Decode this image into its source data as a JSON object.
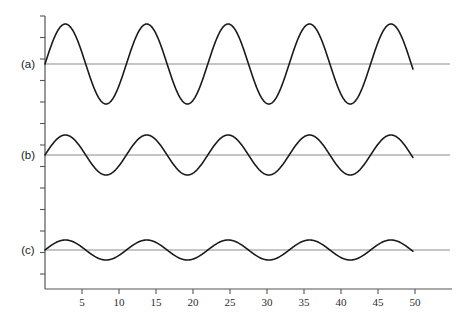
{
  "figure": {
    "background_color": "#ffffff",
    "curve_color": "#1a1a1a",
    "baseline_color": "#8c8c8c",
    "axis_color": "#555555",
    "tick_label_color": "#2b2b2b"
  },
  "chart_data": {
    "type": "line",
    "title": "",
    "subtitle": "",
    "xlabel": "",
    "ylabel": "",
    "grid": false,
    "legend_position": "left",
    "xlim": [
      0,
      55
    ],
    "ylim": [
      -1.1,
      1.1
    ],
    "x_ticks": [
      5,
      10,
      15,
      20,
      25,
      30,
      35,
      40,
      45,
      50
    ],
    "x_tick_labels": [
      "5",
      "10",
      "15",
      "20",
      "25",
      "30",
      "35",
      "40",
      "45",
      "50"
    ],
    "y_ticks": [],
    "y_tick_labels": [],
    "x_start": 0,
    "x_end": 50,
    "period_units": 11.0,
    "series": [
      {
        "name": "(a)",
        "label": "(a)",
        "amplitude": 1.0,
        "amplitude_px": 40,
        "period_units": 11.0,
        "phase": 0,
        "baseline_y_px": 64,
        "peak_count": 5,
        "peak_x_values": [
          2.75,
          13.75,
          24.75,
          35.75,
          46.75
        ],
        "trough_x_values": [
          8.25,
          19.25,
          30.25,
          41.25
        ],
        "waveform": "sine"
      },
      {
        "name": "(b)",
        "label": "(b)",
        "amplitude": 0.5,
        "amplitude_px": 20,
        "period_units": 11.0,
        "phase": 0,
        "baseline_y_px": 155,
        "peak_count": 5,
        "peak_x_values": [
          2.75,
          13.75,
          24.75,
          35.75,
          46.75
        ],
        "trough_x_values": [
          8.25,
          19.25,
          30.25,
          41.25
        ],
        "waveform": "sine"
      },
      {
        "name": "(c)",
        "label": "(c)",
        "amplitude": 0.25,
        "amplitude_px": 10,
        "period_units": 11.0,
        "phase": 0,
        "baseline_y_px": 250,
        "peak_count": 5,
        "peak_x_values": [
          2.75,
          13.75,
          24.75,
          35.75,
          46.75
        ],
        "trough_x_values": [
          8.25,
          19.25,
          30.25,
          41.25
        ],
        "waveform": "sine"
      }
    ],
    "annotations": [
      {
        "text": "(a)",
        "x_px": 28,
        "y_px": 68
      },
      {
        "text": "(b)",
        "x_px": 28,
        "y_px": 159
      },
      {
        "text": "(c)",
        "x_px": 28,
        "y_px": 254
      }
    ]
  },
  "geometry": {
    "y_axis_x_px": 45,
    "x_axis_y_px": 289,
    "x_axis_right_px": 452,
    "baseline_right_px": 450,
    "curve_end_px": 413,
    "px_per_unit": 7.4,
    "y_axis_top_px": 16,
    "y_tick_spacing_px": 21.5,
    "y_tick_count": 13,
    "x_tick_length_px": 5,
    "y_tick_length_px": 5
  }
}
